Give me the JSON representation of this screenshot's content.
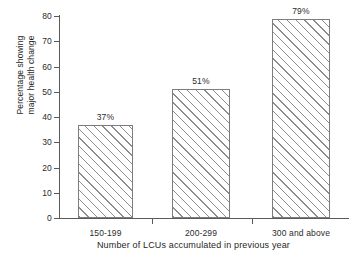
{
  "chart_data": {
    "type": "bar",
    "title": "",
    "categories": [
      "150-199",
      "200-299",
      "300 and above"
    ],
    "values": [
      37,
      51,
      79
    ],
    "data_labels": [
      "37%",
      "51%",
      "79%"
    ],
    "xlabel": "Number of LCUs accumulated in previous year",
    "ylabel_line1": "Percentage showing",
    "ylabel_line2": "major health change",
    "ylim": [
      0,
      80
    ],
    "y_ticks": [
      0,
      10,
      20,
      30,
      40,
      50,
      60,
      70,
      80
    ],
    "y_tick_labels": [
      "0",
      "10",
      "20",
      "30",
      "40",
      "50",
      "60",
      "70",
      "80"
    ],
    "grid": false,
    "legend": "none",
    "bar_fill": "hatch-diagonal-forward",
    "colors": {
      "background": "#ffffff",
      "axis": "#5a5a5a",
      "bar_outline": "#7d7d7d",
      "hatch": "#8d8d8d",
      "text": "#2b2b2b"
    }
  }
}
